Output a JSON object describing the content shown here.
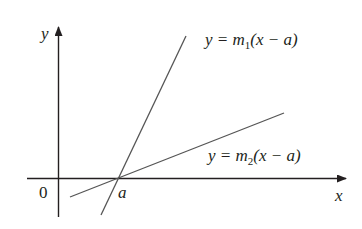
{
  "diagram": {
    "type": "coordinate-plot",
    "axes": {
      "x_label": "x",
      "y_label": "y",
      "origin_label": "0"
    },
    "point_label": "a",
    "lines": [
      {
        "name": "steep",
        "equation_prefix": "y = m",
        "subscript": "1",
        "equation_suffix": "(x − a)"
      },
      {
        "name": "shallow",
        "equation_prefix": "y = m",
        "subscript": "2",
        "equation_suffix": "(x − a)"
      }
    ],
    "colors": {
      "axis": "#231f20",
      "line": "#555555"
    }
  }
}
